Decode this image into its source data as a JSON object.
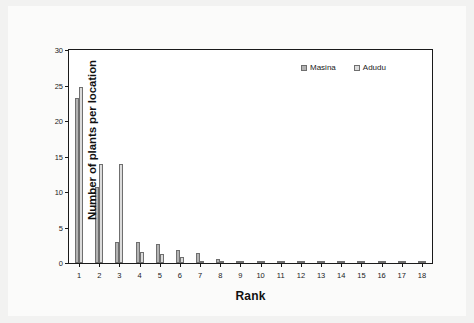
{
  "chart_data": {
    "type": "bar",
    "title": "",
    "subtitle": "",
    "xlabel": "Rank",
    "ylabel": "Number of plants per location",
    "categories": [
      "1",
      "2",
      "3",
      "4",
      "5",
      "6",
      "7",
      "8",
      "9",
      "10",
      "11",
      "12",
      "13",
      "14",
      "15",
      "16",
      "17",
      "18"
    ],
    "series": [
      {
        "name": "Masina",
        "color": "#b3b3b3",
        "values": [
          23.2,
          10.7,
          2.9,
          2.9,
          2.7,
          1.8,
          1.4,
          0.6,
          0.35,
          0.3,
          0.3,
          0.12,
          0.1,
          0.1,
          0.1,
          0.1,
          0.1,
          0.1
        ]
      },
      {
        "name": "Adudu",
        "color": "#dcdcdc",
        "values": [
          24.8,
          14.0,
          14.0,
          1.5,
          1.2,
          0.8,
          0.2,
          0.1,
          0.15,
          0.12,
          0.1,
          0.08,
          0.05,
          0.05,
          0.05,
          0.05,
          0.05,
          0.05
        ]
      }
    ],
    "ylim": [
      0,
      30
    ],
    "yticks": [
      0,
      5,
      10,
      15,
      20,
      25,
      30
    ],
    "ytick_labels": [
      "0",
      "5",
      "10",
      "15",
      "20",
      "25",
      "30"
    ],
    "xlim": [
      0.5,
      18.5
    ],
    "grid": false,
    "legend_position": "top-right",
    "legend_entries": [
      "Masina",
      "Adudu"
    ],
    "annotations": [],
    "background_color": "#ffffff",
    "page_background_color": "#f2f2f1",
    "axis_color": "#1a1a1a",
    "bar_edge_color": "#6f6f6f"
  }
}
